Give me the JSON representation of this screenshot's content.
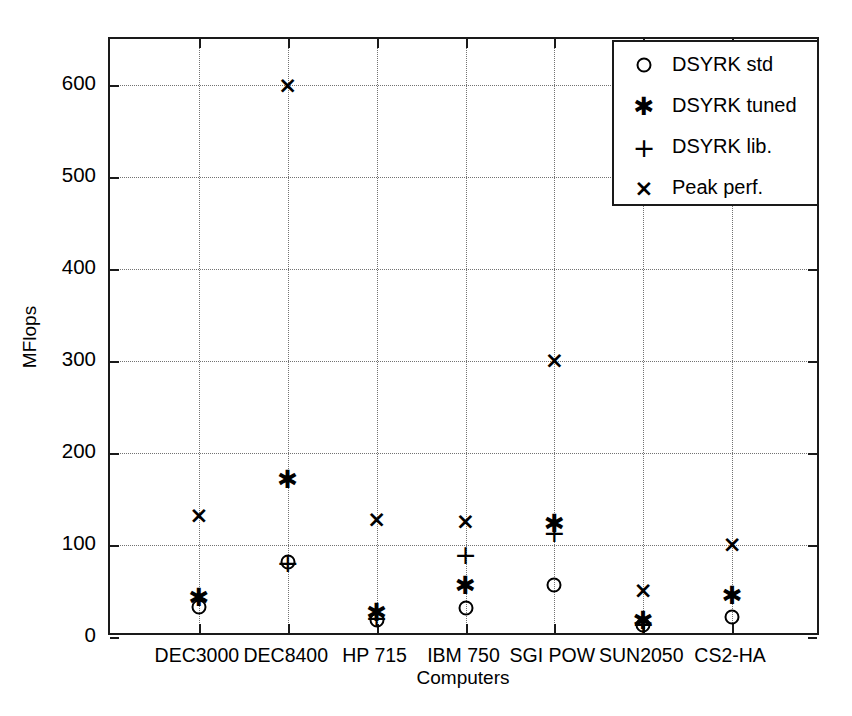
{
  "chart_data": {
    "type": "scatter",
    "title": "",
    "xlabel": "Computers",
    "ylabel": "MFlops",
    "categories": [
      "DEC3000",
      "DEC8400",
      "HP 715",
      "IBM 750",
      "SGI POW",
      "SUN2050",
      "CS2-HA"
    ],
    "ylim": [
      0,
      650
    ],
    "yticks": [
      0,
      100,
      200,
      300,
      400,
      500,
      600
    ],
    "ytick_labels": [
      "0",
      "100",
      "200",
      "300",
      "400",
      "500",
      "600"
    ],
    "grid": true,
    "legend_position": "top-right",
    "series": [
      {
        "name": "DSYRK std",
        "marker": "circle",
        "values": [
          33,
          82,
          18,
          32,
          57,
          13,
          22
        ]
      },
      {
        "name": "DSYRK tuned",
        "marker": "star",
        "values": [
          43,
          172,
          27,
          57,
          124,
          19,
          46
        ]
      },
      {
        "name": "DSYRK lib.",
        "marker": "plus",
        "values": [
          null,
          82,
          22,
          90,
          114,
          15,
          null
        ]
      },
      {
        "name": "Peak perf.",
        "marker": "ex",
        "values": [
          133,
          600,
          128,
          126,
          301,
          51,
          101
        ]
      }
    ]
  },
  "legend": {
    "entries": [
      {
        "label": "DSYRK std",
        "marker": "circle"
      },
      {
        "label": "DSYRK tuned",
        "marker": "star"
      },
      {
        "label": "DSYRK lib.",
        "marker": "plus"
      },
      {
        "label": "Peak perf.",
        "marker": "ex"
      }
    ]
  },
  "axes": {
    "y_title": "MFlops",
    "x_title": "Computers"
  },
  "colors": {
    "foreground": "#000000",
    "frame": "#1a1a1a",
    "grid": "#5a5a5a",
    "background": "#ffffff"
  }
}
